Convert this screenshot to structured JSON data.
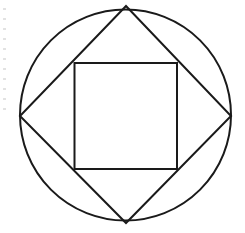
{
  "diagram": {
    "stroke_color": "#1a1a1a",
    "background": "#ffffff",
    "stroke_width": 2,
    "circle": {
      "cx": 125.5,
      "cy": 115,
      "r": 105.5
    },
    "diamond": {
      "points": [
        [
          126,
          6
        ],
        [
          231,
          116
        ],
        [
          126,
          223
        ],
        [
          20,
          116
        ]
      ]
    },
    "inner_square": {
      "x": 74.5,
      "y": 63,
      "width": 102.5,
      "height": 106
    }
  }
}
